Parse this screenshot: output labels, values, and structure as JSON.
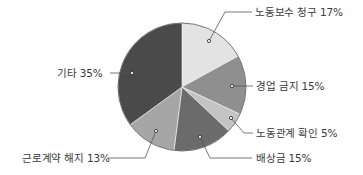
{
  "chart_data": {
    "type": "pie",
    "title": "",
    "start_angle_deg": 0,
    "direction": "clockwise",
    "slices": [
      {
        "label": "노동보수 청구",
        "value": 17,
        "text": "노동보수 청구  17%",
        "color": "#e3e3e3"
      },
      {
        "label": "경업 금지",
        "value": 15,
        "text": "경업 금지  15%",
        "color": "#8f8f8f"
      },
      {
        "label": "노동관계 확인",
        "value": 5,
        "text": "노동관계 확인  5%",
        "color": "#c4c4c4"
      },
      {
        "label": "배상금",
        "value": 15,
        "text": "배상금  15%",
        "color": "#6b6b6b"
      },
      {
        "label": "근로계약 해지",
        "value": 13,
        "text": "근로계약 해지  13%",
        "color": "#a6a6a6"
      },
      {
        "label": "기타",
        "value": 35,
        "text": "기타  35%",
        "color": "#4a4a4a"
      }
    ],
    "legend": "none (leader-line labels)",
    "grid": false
  },
  "labels": {
    "l0": "노동보수 청구  17%",
    "l1": "경업 금지  15%",
    "l2": "노동관계 확인  5%",
    "l3": "배상금  15%",
    "l4": "근로계약 해지  13%",
    "l5": "기타  35%"
  }
}
